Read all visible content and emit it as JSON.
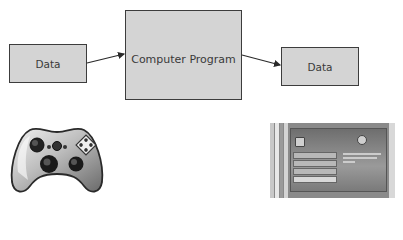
{
  "diagram": {
    "nodes": [
      {
        "id": "input",
        "label": "Data"
      },
      {
        "id": "program",
        "label": "Computer Program"
      },
      {
        "id": "output",
        "label": "Data"
      }
    ],
    "edges": [
      {
        "from": "input",
        "to": "program"
      },
      {
        "from": "program",
        "to": "output"
      }
    ]
  },
  "images": {
    "controller": {
      "icon": "game-controller-icon"
    },
    "screenshot": {
      "icon": "game-menu-screenshot",
      "menu_items": [
        "",
        "",
        "",
        ""
      ]
    }
  },
  "colors": {
    "box_fill": "#d4d4d4",
    "box_border": "#3c3c3c",
    "arrow": "#2a2a2a",
    "text": "#3a3a3a"
  }
}
